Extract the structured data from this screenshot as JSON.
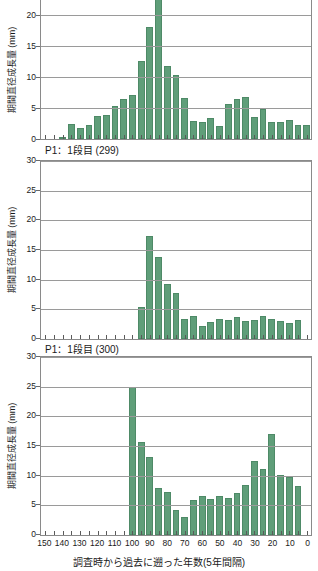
{
  "figure": {
    "width": 318,
    "height": 571,
    "bar_color": "#5f9e79",
    "bar_edge_color": "#4e8a67",
    "grid_color": "#9a9a9a",
    "axis_color": "#8a8a8a"
  },
  "axis": {
    "x_title": "調査時から過去に遡った年数(5年間隔)",
    "y_title": "期間直径成長量 (mm)",
    "x_tick_labels": [
      "150",
      "140",
      "130",
      "120",
      "110",
      "100",
      "90",
      "80",
      "70",
      "60",
      "50",
      "40",
      "30",
      "20",
      "10",
      "0"
    ],
    "x_tick_values": [
      150,
      140,
      130,
      120,
      110,
      100,
      90,
      80,
      70,
      60,
      50,
      40,
      30,
      20,
      10,
      0
    ],
    "x_min": 152.5,
    "x_max": -2.5,
    "y_tick_labels_full": [
      "0",
      "5",
      "10",
      "15",
      "20",
      "25",
      "30"
    ],
    "y_tick_values_full": [
      0,
      5,
      10,
      15,
      20,
      25,
      30
    ],
    "y_tick_labels_top": [
      "0",
      "5",
      "10",
      "15",
      "20"
    ],
    "y_tick_values_top": [
      0,
      5,
      10,
      15,
      20
    ]
  },
  "captions": {
    "panel0_to_panel1": "P1：1段目 (299)",
    "panel1_to_panel2": "P1：1段目 (300)"
  },
  "chart_data": [
    {
      "type": "bar",
      "title": "",
      "panel_index": 0,
      "note": "top panel is cropped at the top of the image; tallest bar extends beyond the visible axis",
      "xlabel": "調査時から過去に遡った年数(5年間隔)",
      "ylabel": "期間直径成長量 (mm)",
      "ylim": [
        0,
        22.5
      ],
      "ylim_visible_top": 22.5,
      "xlim": [
        152.5,
        -2.5
      ],
      "grid": true,
      "categories": [
        130,
        125,
        120,
        115,
        110,
        105,
        100,
        95,
        90,
        85,
        80,
        75,
        70,
        65,
        60,
        55,
        50,
        45,
        40,
        35,
        30,
        25,
        20,
        15,
        10,
        5,
        0
      ],
      "values": [
        0.4,
        2.5,
        1.8,
        2.2,
        3.7,
        3.9,
        5.3,
        6.5,
        7.1,
        12.6,
        18.1,
        25.5,
        11.9,
        10.4,
        6.7,
        2.9,
        2.8,
        3.4,
        2.1,
        5.7,
        6.5,
        6.8,
        3.6,
        4.8,
        2.7,
        2.8,
        3.0
      ],
      "extra_categories_tail": [
        -0.0
      ],
      "series": [
        {
          "name": "P1 期間直径成長量",
          "values": [
            0.4,
            2.5,
            1.8,
            2.2,
            3.7,
            3.9,
            5.3,
            6.5,
            7.1,
            12.6,
            18.1,
            25.5,
            11.9,
            10.4,
            6.7,
            2.9,
            2.8,
            3.4,
            2.1,
            5.7,
            6.5,
            6.8,
            3.6,
            4.8,
            2.7,
            2.8,
            3.0,
            2.3,
            2.3
          ]
        }
      ],
      "bars": [
        {
          "x": 140,
          "y": 0.4
        },
        {
          "x": 135,
          "y": 2.5
        },
        {
          "x": 130,
          "y": 1.8
        },
        {
          "x": 125,
          "y": 2.2
        },
        {
          "x": 120,
          "y": 3.7
        },
        {
          "x": 115,
          "y": 3.9
        },
        {
          "x": 110,
          "y": 5.3
        },
        {
          "x": 105,
          "y": 6.5
        },
        {
          "x": 100,
          "y": 7.1
        },
        {
          "x": 95,
          "y": 12.6
        },
        {
          "x": 90,
          "y": 18.1
        },
        {
          "x": 85,
          "y": 25.5
        },
        {
          "x": 80,
          "y": 11.9
        },
        {
          "x": 75,
          "y": 10.4
        },
        {
          "x": 70,
          "y": 6.7
        },
        {
          "x": 65,
          "y": 2.9
        },
        {
          "x": 60,
          "y": 2.8
        },
        {
          "x": 55,
          "y": 3.4
        },
        {
          "x": 50,
          "y": 2.1
        },
        {
          "x": 45,
          "y": 5.7
        },
        {
          "x": 40,
          "y": 6.5
        },
        {
          "x": 35,
          "y": 6.8
        },
        {
          "x": 30,
          "y": 3.6
        },
        {
          "x": 25,
          "y": 4.8
        },
        {
          "x": 20,
          "y": 2.7
        },
        {
          "x": 15,
          "y": 2.8
        },
        {
          "x": 10,
          "y": 3.0
        },
        {
          "x": 5,
          "y": 2.3
        },
        {
          "x": 0,
          "y": 2.3
        }
      ]
    },
    {
      "type": "bar",
      "title": "P1：1段目 (299)",
      "panel_index": 1,
      "xlabel": "調査時から過去に遡った年数(5年間隔)",
      "ylabel": "期間直径成長量 (mm)",
      "ylim": [
        0,
        30
      ],
      "xlim": [
        152.5,
        -2.5
      ],
      "grid": true,
      "categories": [
        95,
        90,
        85,
        80,
        75,
        70,
        65,
        60,
        55,
        50,
        45,
        40,
        35,
        30,
        25,
        20,
        15,
        10,
        5,
        0
      ],
      "values": [
        5.4,
        17.4,
        13.8,
        9.2,
        7.7,
        3.4,
        3.9,
        2.2,
        2.9,
        3.4,
        3.2,
        3.7,
        3.0,
        3.2,
        3.9,
        3.4,
        3.1,
        2.7,
        3.2
      ],
      "series": [
        {
          "name": "P1 1段目 (299) 期間直径成長量",
          "values": [
            5.4,
            17.4,
            13.8,
            9.2,
            7.7,
            3.4,
            3.9,
            2.2,
            2.9,
            3.4,
            3.2,
            3.7,
            3.0,
            3.2,
            3.9,
            3.4,
            3.1,
            2.7,
            3.2
          ]
        }
      ],
      "bars": [
        {
          "x": 95,
          "y": 5.4
        },
        {
          "x": 90,
          "y": 17.4
        },
        {
          "x": 85,
          "y": 13.8
        },
        {
          "x": 80,
          "y": 9.2
        },
        {
          "x": 75,
          "y": 7.7
        },
        {
          "x": 70,
          "y": 3.4
        },
        {
          "x": 65,
          "y": 3.9
        },
        {
          "x": 60,
          "y": 2.2
        },
        {
          "x": 55,
          "y": 2.9
        },
        {
          "x": 50,
          "y": 3.4
        },
        {
          "x": 45,
          "y": 3.2
        },
        {
          "x": 40,
          "y": 3.7
        },
        {
          "x": 35,
          "y": 3.0
        },
        {
          "x": 30,
          "y": 3.2
        },
        {
          "x": 25,
          "y": 3.9
        },
        {
          "x": 20,
          "y": 3.4
        },
        {
          "x": 15,
          "y": 3.1
        },
        {
          "x": 10,
          "y": 2.7
        },
        {
          "x": 5,
          "y": 3.2
        }
      ]
    },
    {
      "type": "bar",
      "title": "P1：1段目 (300)",
      "panel_index": 2,
      "xlabel": "調査時から過去に遡った年数(5年間隔)",
      "ylabel": "期間直径成長量 (mm)",
      "ylim": [
        0,
        30
      ],
      "xlim": [
        152.5,
        -2.5
      ],
      "grid": true,
      "categories": [
        100,
        95,
        90,
        85,
        80,
        75,
        70,
        65,
        60,
        55,
        50,
        45,
        40,
        35,
        30,
        25,
        20,
        15,
        10,
        5,
        0
      ],
      "values": [
        25.0,
        15.7,
        13.1,
        7.9,
        7.2,
        4.3,
        3.0,
        5.9,
        6.5,
        6.1,
        6.6,
        6.3,
        7.0,
        8.5,
        12.4,
        11.2,
        17.0,
        10.1,
        9.8,
        8.2
      ],
      "series": [
        {
          "name": "P1 1段目 (300) 期間直径成長量",
          "values": [
            25.0,
            15.7,
            13.1,
            7.9,
            7.2,
            4.3,
            3.0,
            5.9,
            6.5,
            6.1,
            6.6,
            6.3,
            7.0,
            8.5,
            12.4,
            11.2,
            17.0,
            10.1,
            9.8,
            8.2
          ]
        }
      ],
      "bars": [
        {
          "x": 100,
          "y": 25.0
        },
        {
          "x": 95,
          "y": 15.7
        },
        {
          "x": 90,
          "y": 13.1
        },
        {
          "x": 85,
          "y": 7.9
        },
        {
          "x": 80,
          "y": 7.2
        },
        {
          "x": 75,
          "y": 4.3
        },
        {
          "x": 70,
          "y": 3.0
        },
        {
          "x": 65,
          "y": 5.9
        },
        {
          "x": 60,
          "y": 6.5
        },
        {
          "x": 55,
          "y": 6.1
        },
        {
          "x": 50,
          "y": 6.6
        },
        {
          "x": 45,
          "y": 6.3
        },
        {
          "x": 40,
          "y": 7.0
        },
        {
          "x": 35,
          "y": 8.5
        },
        {
          "x": 30,
          "y": 12.4
        },
        {
          "x": 25,
          "y": 11.2
        },
        {
          "x": 20,
          "y": 17.0
        },
        {
          "x": 15,
          "y": 10.1
        },
        {
          "x": 10,
          "y": 9.8
        },
        {
          "x": 5,
          "y": 8.2
        }
      ]
    }
  ]
}
